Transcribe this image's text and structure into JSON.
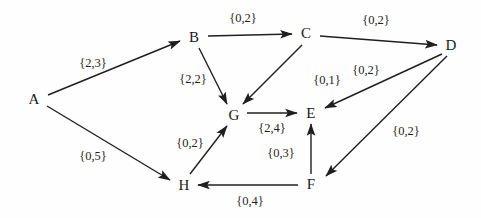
{
  "diagram": {
    "type": "directed-graph",
    "title": "",
    "background_color": "#fefefe",
    "stroke_color": "#1f1f1f",
    "nodes": [
      {
        "id": "A",
        "label": "A",
        "x": 34,
        "y": 99
      },
      {
        "id": "B",
        "label": "B",
        "x": 194,
        "y": 37
      },
      {
        "id": "C",
        "label": "C",
        "x": 306,
        "y": 33
      },
      {
        "id": "D",
        "label": "D",
        "x": 451,
        "y": 45
      },
      {
        "id": "E",
        "label": "E",
        "x": 311,
        "y": 113
      },
      {
        "id": "F",
        "label": "F",
        "x": 311,
        "y": 184
      },
      {
        "id": "G",
        "label": "G",
        "x": 234,
        "y": 115
      },
      {
        "id": "H",
        "label": "H",
        "x": 184,
        "y": 185
      }
    ],
    "edges": [
      {
        "from": "A",
        "to": "B",
        "label": "{2,3}",
        "label_x": 93,
        "label_y": 63,
        "x1": 48,
        "y1": 95,
        "x2": 180,
        "y2": 41
      },
      {
        "from": "A",
        "to": "H",
        "label": "{0,5}",
        "label_x": 93,
        "label_y": 156,
        "x1": 47,
        "y1": 106,
        "x2": 170,
        "y2": 180
      },
      {
        "from": "B",
        "to": "C",
        "label": "{0,2}",
        "label_x": 243,
        "label_y": 18,
        "x1": 208,
        "y1": 36,
        "x2": 292,
        "y2": 34
      },
      {
        "from": "B",
        "to": "G",
        "label": "{2,2}",
        "label_x": 193,
        "label_y": 79,
        "x1": 199,
        "y1": 48,
        "x2": 227,
        "y2": 104
      },
      {
        "from": "C",
        "to": "D",
        "label": "{0,2}",
        "label_x": 376,
        "label_y": 20,
        "x1": 320,
        "y1": 36,
        "x2": 437,
        "y2": 45
      },
      {
        "from": "C",
        "to": "G",
        "label": "{0,1}",
        "label_x": 327,
        "label_y": 80,
        "x1": 302,
        "y1": 45,
        "x2": 243,
        "y2": 104
      },
      {
        "from": "D",
        "to": "E",
        "label": "{0,2}",
        "label_x": 366,
        "label_y": 70,
        "x1": 442,
        "y1": 54,
        "x2": 325,
        "y2": 108
      },
      {
        "from": "D",
        "to": "F",
        "label": "{0,2}",
        "label_x": 406,
        "label_y": 131,
        "x1": 447,
        "y1": 56,
        "x2": 326,
        "y2": 176
      },
      {
        "from": "F",
        "to": "E",
        "label": "{0,3}",
        "label_x": 281,
        "label_y": 153,
        "x1": 311,
        "y1": 174,
        "x2": 311,
        "y2": 124
      },
      {
        "from": "F",
        "to": "H",
        "label": "{0,4}",
        "label_x": 250,
        "label_y": 201,
        "x1": 298,
        "y1": 185,
        "x2": 198,
        "y2": 185
      },
      {
        "from": "G",
        "to": "E",
        "label": "{2,4}",
        "label_x": 272,
        "label_y": 128,
        "x1": 247,
        "y1": 113,
        "x2": 297,
        "y2": 113
      },
      {
        "from": "H",
        "to": "G",
        "label": "{0,2}",
        "label_x": 190,
        "label_y": 143,
        "x1": 190,
        "y1": 174,
        "x2": 227,
        "y2": 126
      }
    ]
  }
}
